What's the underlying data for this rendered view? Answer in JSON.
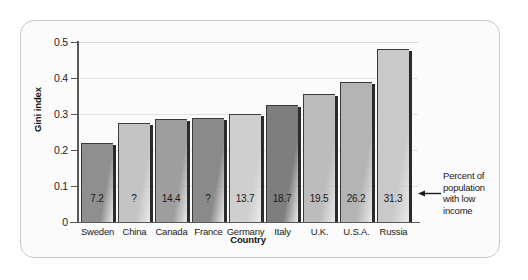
{
  "chart_data": {
    "type": "bar",
    "title": "",
    "xlabel": "Country",
    "ylabel": "Gini index",
    "ylim": [
      0,
      0.5
    ],
    "yticks": [
      "0.5",
      "0.4",
      "0.3",
      "0.2",
      "0.1",
      "0"
    ],
    "ytick_values": [
      0.5,
      0.4,
      0.3,
      0.2,
      0.1,
      0
    ],
    "grid": "horizontal",
    "legend": "none",
    "categories": [
      "Sweden",
      "China",
      "Canada",
      "France",
      "Germany",
      "Italy",
      "U.K.",
      "U.S.A.",
      "Russia"
    ],
    "values": [
      0.22,
      0.275,
      0.285,
      0.29,
      0.3,
      0.325,
      0.355,
      0.39,
      0.48
    ],
    "bar_labels": [
      "7.2",
      "?",
      "14.4",
      "?",
      "13.7",
      "18.7",
      "19.5",
      "26.2",
      "31.3"
    ],
    "bar_label_meaning": "Percent of population with low income",
    "bar_colors": [
      "#8f8f8f",
      "#c4c4c4",
      "#9e9e9e",
      "#8a8a8a",
      "#cfcfcf",
      "#7e7e7e",
      "#bcbcbc",
      "#b4b4b4",
      "#c9c9c9"
    ],
    "annotations": [
      {
        "name": "bar-value-explanation",
        "lines": [
          "Percent of",
          "population",
          "with low",
          "income"
        ],
        "arrow": "left-arrow-icon"
      }
    ]
  },
  "figure": {
    "border_color": "#c8c8c8",
    "background_color": "#fbfbfb",
    "axis_color": "#585858"
  }
}
